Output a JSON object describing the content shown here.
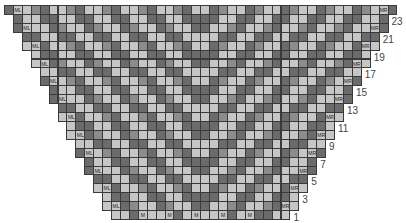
{
  "chart": {
    "title": "",
    "type": "knitting-chart",
    "total_rows": 24,
    "top_row_stitches": 44,
    "bottom_row_stitches": 20,
    "row_labels": [
      "23",
      "21",
      "19",
      "17",
      "15",
      "13",
      "11",
      "9",
      "7",
      "5",
      "3",
      "1"
    ],
    "markers": {
      "left": "ML",
      "right": "MR",
      "bottom": "M"
    },
    "bottom_m_positions": [
      3,
      6,
      9,
      12,
      15
    ],
    "colors": {
      "light": "#c6c6c6",
      "mid": "#8c8c8c",
      "dark": "#6b6b6b",
      "grid": "#3a3a3a",
      "label": "#444444"
    }
  }
}
